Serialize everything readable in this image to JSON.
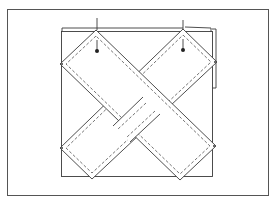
{
  "diagram": {
    "type": "line-illustration",
    "colors": {
      "background": "#ffffff",
      "line": "#3a3a3a",
      "frame": "#555555"
    },
    "elements": {
      "frame": "outer border",
      "panel": "square base panel",
      "back_panel": "offset back layer",
      "strip_a": "diagonal strip top-left to bottom-right",
      "strip_b": "diagonal strip top-right to bottom-left",
      "pins": [
        "pin-left",
        "pin-right"
      ]
    }
  }
}
